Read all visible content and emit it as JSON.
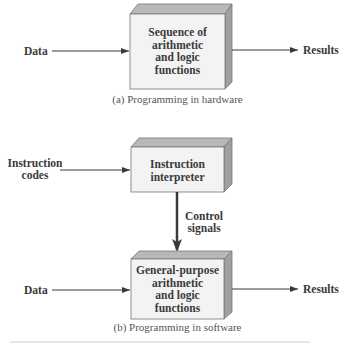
{
  "diagram": {
    "panel_a": {
      "caption": "(a) Programming in hardware",
      "input_label": "Data",
      "output_label": "Results",
      "box": {
        "lines": [
          "Sequence of",
          "arithmetic",
          "and logic",
          "functions"
        ]
      }
    },
    "panel_b": {
      "caption": "(b) Programming in software",
      "instruction_input_label": [
        "Instruction",
        "codes"
      ],
      "interpreter_box": {
        "lines": [
          "Instruction",
          "interpreter"
        ]
      },
      "control_label": [
        "Control",
        "signals"
      ],
      "function_box": {
        "lines": [
          "General-purpose",
          "arithmetic",
          "and logic",
          "functions"
        ]
      },
      "input_label": "Data",
      "output_label": "Results"
    },
    "colors": {
      "box_front": "#f3f3f3",
      "box_top": "#b8b8b8",
      "box_side": "#a0a0a0",
      "line": "#3a3a3a"
    }
  }
}
